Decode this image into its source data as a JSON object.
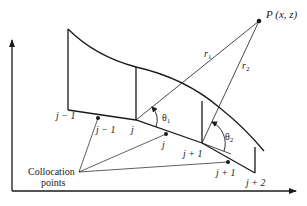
{
  "diagram": {
    "type": "panel-method geometry",
    "point": {
      "label": "P (x, z)",
      "name": "P",
      "coords": "(x, z)"
    },
    "distances": [
      {
        "label": "r",
        "sub": "1"
      },
      {
        "label": "r",
        "sub": "2"
      }
    ],
    "angles": [
      {
        "label": "θ",
        "sub": "1"
      },
      {
        "label": "θ",
        "sub": "2"
      }
    ],
    "panel_nodes": [
      "j − 1",
      "j",
      "j + 1",
      "j + 2"
    ],
    "collocation_point_labels": [
      "j − 1",
      "j",
      "j + 1"
    ],
    "collocation_caption": {
      "line1": "Collocation",
      "line2": "points"
    },
    "colors": {
      "ink": "#1a1a1a",
      "background": "#ffffff"
    }
  }
}
